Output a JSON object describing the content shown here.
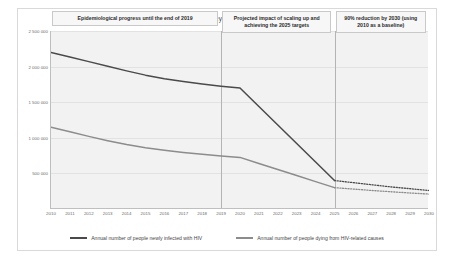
{
  "chart_data": {
    "type": "line",
    "title": "Progress required to reach key 2025 and 2030 global HIV targets",
    "xlabel": "",
    "ylabel": "",
    "ylim": [
      0,
      2500000
    ],
    "xlim": [
      2010,
      2030
    ],
    "grid": true,
    "legend_position": "bottom",
    "y_ticks": [
      "2 500 000",
      "2 000 000",
      "1 500 000",
      "1 000 000",
      "500 000"
    ],
    "y_tick_values": [
      2500000,
      2000000,
      1500000,
      1000000,
      500000
    ],
    "x": [
      2010,
      2011,
      2012,
      2013,
      2014,
      2015,
      2016,
      2017,
      2018,
      2019,
      2020,
      2021,
      2022,
      2023,
      2024,
      2025,
      2026,
      2027,
      2028,
      2029,
      2030
    ],
    "categories": [
      "2010",
      "2011",
      "2012",
      "2013",
      "2014",
      "2015",
      "2016",
      "2017",
      "2018",
      "2019",
      "2020",
      "2021",
      "2022",
      "2023",
      "2024",
      "2025",
      "2026",
      "2027",
      "2028",
      "2029",
      "2030"
    ],
    "series": [
      {
        "name": "Annual number of people newly infected with HIV",
        "color": "#4a4a4a",
        "values": [
          2200000,
          2135000,
          2070000,
          2005000,
          1940000,
          1880000,
          1830000,
          1790000,
          1755000,
          1725000,
          1700000,
          1440000,
          1180000,
          920000,
          660000,
          400000,
          370000,
          340000,
          310000,
          285000,
          260000
        ],
        "projection_start_index": 10,
        "dotted_start_index": 15
      },
      {
        "name": "Annual number of people dying from HIV-related causes",
        "color": "#8c8c8c",
        "values": [
          1150000,
          1085000,
          1020000,
          960000,
          905000,
          860000,
          825000,
          795000,
          770000,
          745000,
          725000,
          640000,
          555000,
          470000,
          385000,
          300000,
          280000,
          260000,
          242000,
          225000,
          210000
        ],
        "projection_start_index": 10,
        "dotted_start_index": 15
      }
    ],
    "panels": [
      {
        "id": "panel-historical",
        "label": "Epidemiological progress until the end of 2019",
        "start_year": 2010,
        "end_year": 2019
      },
      {
        "id": "panel-projection",
        "label": "Projected impact of scaling up and achieving the 2025 targets",
        "start_year": 2019,
        "end_year": 2025
      },
      {
        "id": "panel-target",
        "label": "90% reduction by 2030 (using 2010 as a baseline)",
        "start_year": 2025,
        "end_year": 2030
      }
    ]
  }
}
